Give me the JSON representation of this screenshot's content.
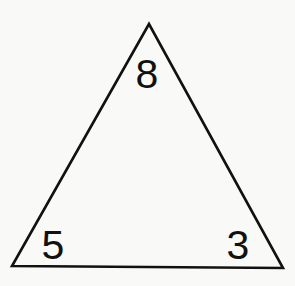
{
  "diagram": {
    "type": "triangle-number-puzzle",
    "shape": "triangle",
    "stroke_color": "#111111",
    "background_color": "#f9f9f7",
    "vertices": {
      "top": {
        "x": 149,
        "y": 24
      },
      "bottom_left": {
        "x": 12,
        "y": 266
      },
      "bottom_right": {
        "x": 283,
        "y": 268
      }
    },
    "numbers": {
      "top": "8",
      "bottom_left": "5",
      "bottom_right": "3"
    }
  }
}
